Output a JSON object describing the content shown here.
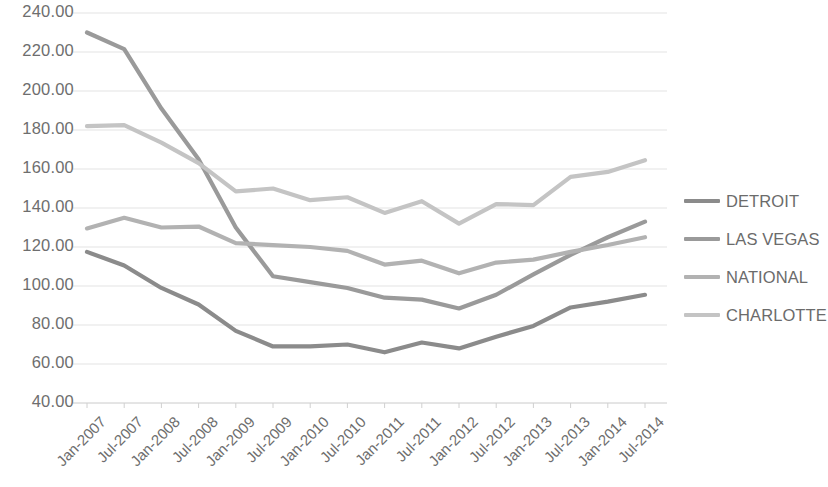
{
  "chart_data": {
    "type": "line",
    "title": "",
    "xlabel": "",
    "ylabel": "",
    "grid": true,
    "legend_position": "right",
    "ylim": [
      40,
      240
    ],
    "yticks": [
      "40.00",
      "60.00",
      "80.00",
      "100.00",
      "120.00",
      "140.00",
      "160.00",
      "180.00",
      "200.00",
      "220.00",
      "240.00"
    ],
    "ytick_values": [
      40,
      60,
      80,
      100,
      120,
      140,
      160,
      180,
      200,
      220,
      240
    ],
    "categories": [
      "Jan-2007",
      "Jul-2007",
      "Jan-2008",
      "Jul-2008",
      "Jan-2009",
      "Jul-2009",
      "Jan-2010",
      "Jul-2010",
      "Jan-2011",
      "Jul-2011",
      "Jan-2012",
      "Jul-2012",
      "Jan-2013",
      "Jul-2013",
      "Jan-2014",
      "Jul-2014"
    ],
    "series": [
      {
        "name": "DETROIT",
        "color": "#8b8b8b",
        "values": [
          117.5,
          110.5,
          99.0,
          90.5,
          77.0,
          69.0,
          69.0,
          70.0,
          66.0,
          71.0,
          68.0,
          74.0,
          79.5,
          89.0,
          92.0,
          95.5
        ]
      },
      {
        "name": "LAS VEGAS",
        "color": "#9a9a9a",
        "values": [
          230.0,
          221.5,
          191.0,
          165.0,
          130.0,
          105.0,
          102.0,
          99.0,
          94.0,
          93.0,
          88.5,
          95.5,
          106.0,
          116.0,
          125.0,
          133.0
        ]
      },
      {
        "name": "NATIONAL",
        "color": "#b2b2b2",
        "values": [
          129.5,
          135.0,
          130.0,
          130.5,
          122.0,
          121.0,
          120.0,
          118.0,
          111.0,
          113.0,
          106.5,
          112.0,
          113.5,
          117.5,
          121.0,
          125.0
        ]
      },
      {
        "name": "CHARLOTTE",
        "color": "#c4c4c4",
        "values": [
          182.0,
          182.5,
          173.5,
          163.0,
          148.5,
          150.0,
          144.0,
          145.5,
          137.5,
          143.5,
          132.0,
          142.0,
          141.5,
          156.0,
          158.5,
          164.5
        ]
      }
    ]
  },
  "legend": {
    "items": [
      {
        "label": "DETROIT"
      },
      {
        "label": "LAS VEGAS"
      },
      {
        "label": "NATIONAL"
      },
      {
        "label": "CHARLOTTE"
      }
    ]
  }
}
